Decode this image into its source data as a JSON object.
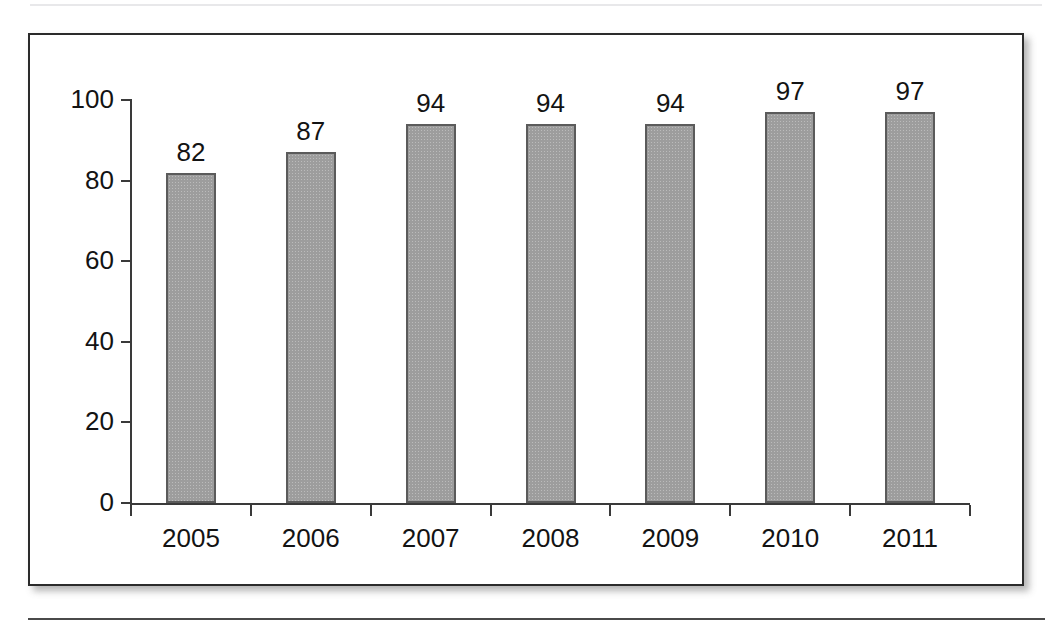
{
  "figure": {
    "frame_border_color": "#2b2b2b",
    "background_color": "#ffffff",
    "top_rule_color": "#e8e8ea",
    "bottom_rule_color": "#4a4a4a"
  },
  "chart_data": {
    "type": "bar",
    "title": "",
    "subtitle": "",
    "xlabel": "",
    "ylabel": "",
    "categories": [
      "2005",
      "2006",
      "2007",
      "2008",
      "2009",
      "2010",
      "2011"
    ],
    "values": [
      82,
      87,
      94,
      94,
      94,
      97,
      97
    ],
    "data_labels": [
      "82",
      "87",
      "94",
      "94",
      "94",
      "97",
      "97"
    ],
    "ylim": [
      0,
      100
    ],
    "yticks": [
      0,
      20,
      40,
      60,
      80,
      100
    ],
    "ytick_labels": [
      "0",
      "20",
      "40",
      "60",
      "80",
      "100"
    ],
    "grid": false,
    "legend": null,
    "legend_position": "none",
    "bar_fill_color": "#9d9d9d",
    "bar_edge_color": "#5b5b5b",
    "axis_color": "#3a3a3a",
    "text_color": "#131313",
    "annotations": []
  }
}
